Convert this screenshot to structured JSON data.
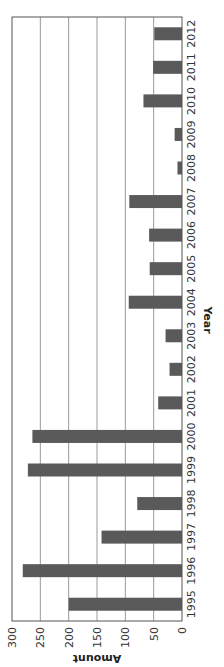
{
  "chart_data": {
    "type": "bar",
    "orientation": "rotated 90 degrees clockwise (vertical bar chart displayed sideways)",
    "title": "",
    "xlabel": "Year",
    "ylabel": "Amount",
    "ylim": [
      0,
      300
    ],
    "yticks": [
      0,
      50,
      100,
      150,
      200,
      250,
      300
    ],
    "grid": true,
    "legend": null,
    "categories": [
      "1995",
      "1996",
      "1997",
      "1998",
      "1999",
      "2000",
      "2001",
      "2002",
      "2003",
      "2004",
      "2005",
      "2006",
      "2007",
      "2008",
      "2009",
      "2010",
      "2011",
      "2012"
    ],
    "values": [
      200,
      281,
      142,
      79,
      272,
      264,
      42,
      22,
      29,
      94,
      57,
      58,
      93,
      8,
      13,
      68,
      51,
      49
    ],
    "bar_color": "#5a5a5a"
  }
}
